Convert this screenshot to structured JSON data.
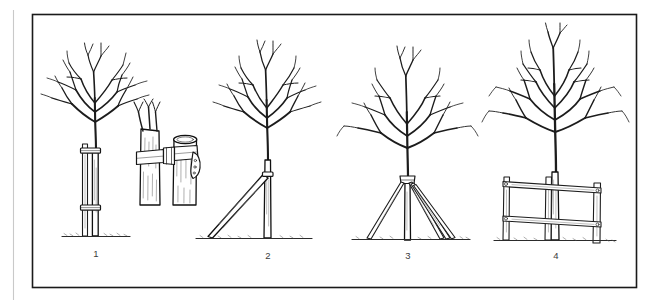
{
  "figure": {
    "background_color": "#fefefe",
    "ink_color": "#1c1c1c",
    "frame_color": "#1a1a1a",
    "left_margin_rule_color": "#c9c9c9",
    "panel_count": 4
  },
  "panels": [
    {
      "number": "1",
      "name": "single-vertical-stake",
      "description": "Young bare-root tree held by a single vertical stake fixed with two ties",
      "tie_count": 2,
      "stake_count": 1,
      "stake_angle_deg": 0
    },
    {
      "number": "2",
      "name": "angled-stake",
      "description": "Tree supported by one stake driven into the ground at an angle and tied high on the trunk",
      "tie_count": 1,
      "stake_count": 1,
      "stake_angle_deg": 45
    },
    {
      "number": "3",
      "name": "guyed-tripod-stakes",
      "description": "Tree held by three angled guy stakes converging at a single tie on the trunk",
      "tie_count": 1,
      "stake_count": 3,
      "stake_angle_deg": 30
    },
    {
      "number": "4",
      "name": "post-and-rail-fence-support",
      "description": "Larger tree braced against a post-and-rail fence with two horizontal rails and three posts",
      "post_count": 3,
      "rail_count": 2
    }
  ],
  "detail_inset": {
    "name": "tie-buckle-detail",
    "description": "Close-up of the buckled tree tie joining the trunk to the stake",
    "parts": [
      "tree-trunk",
      "stake",
      "belt-strap",
      "buckle",
      "strap-tail"
    ]
  },
  "labels": {
    "panel_1": "1",
    "panel_2": "2",
    "panel_3": "3",
    "panel_4": "4"
  }
}
